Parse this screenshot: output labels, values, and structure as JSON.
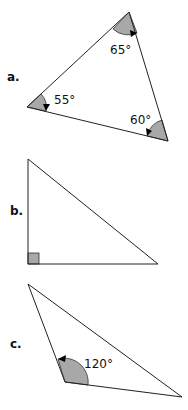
{
  "triangles": [
    {
      "label": "a.",
      "angles": [
        {
          "vertex": "top",
          "value": "65°"
        },
        {
          "vertex": "left",
          "value": "55°"
        },
        {
          "vertex": "right",
          "value": "60°"
        }
      ]
    },
    {
      "label": "b.",
      "angles": [
        {
          "vertex": "bottom-left",
          "value": "right angle"
        }
      ]
    },
    {
      "label": "c.",
      "angles": [
        {
          "vertex": "bottom",
          "value": "120°"
        }
      ]
    }
  ],
  "colors": {
    "shade": "#a8a8a8",
    "line": "#222222"
  }
}
